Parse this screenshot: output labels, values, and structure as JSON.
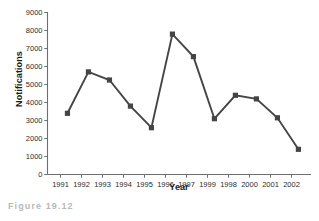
{
  "caption": "Figure 19.12",
  "chart_data": {
    "type": "line",
    "title": "",
    "xlabel": "Year",
    "ylabel": "Notifications",
    "categories": [
      "1991",
      "1992",
      "1993",
      "1994",
      "1995",
      "1996",
      "1997",
      "1999",
      "1998",
      "2000",
      "2001",
      "2002"
    ],
    "values": [
      3400,
      5700,
      5250,
      3800,
      2600,
      7800,
      6550,
      3100,
      4400,
      4200,
      3150,
      1400
    ],
    "ylim": [
      0,
      9000
    ],
    "ytick_labels": [
      "0",
      "1000",
      "2000",
      "3000",
      "4000",
      "5000",
      "6000",
      "7000",
      "8000",
      "9000"
    ],
    "ytick_values": [
      0,
      1000,
      2000,
      3000,
      4000,
      5000,
      6000,
      7000,
      8000,
      9000
    ],
    "grid": false,
    "legend": false,
    "marker": "square",
    "series_color": "#454545",
    "axis_color": "#6e6e6e"
  }
}
